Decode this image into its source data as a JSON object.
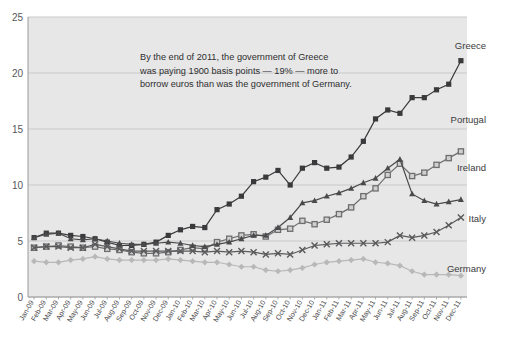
{
  "chart_data": {
    "type": "line",
    "title": "",
    "xlabel": "",
    "ylabel": "",
    "ylim": [
      0,
      25
    ],
    "yticks": [
      0,
      5,
      10,
      15,
      20,
      25
    ],
    "grid": true,
    "legend_position": "right-inline",
    "annotation": {
      "line1": "By the end of 2011, the government of Greece",
      "line2": "was paying 1900 basis points — 19% — more to",
      "line3": "borrow euros than was the government of Germany."
    },
    "categories": [
      "Jan-09",
      "Feb-09",
      "Mar-09",
      "Apr-09",
      "May-09",
      "Jun-09",
      "Jul-09",
      "Aug-09",
      "Sep-09",
      "Oct-09",
      "Nov-09",
      "Dec-09",
      "Jan-10",
      "Feb-10",
      "Mar-10",
      "Apr-10",
      "May-10",
      "Jun-10",
      "Jul-10",
      "Aug-10",
      "Sep-10",
      "Oct-10",
      "Nov-10",
      "Dec-10",
      "Jan-11",
      "Feb-11",
      "Mar-11",
      "Apr-11",
      "May-11",
      "Jun-11",
      "Jul-11",
      "Aug-11",
      "Sep-11",
      "Oct-11",
      "Nov-11",
      "Dec-11"
    ],
    "series": [
      {
        "name": "Greece",
        "color": "#3a3a3c",
        "marker": "square-filled",
        "label_x": 486,
        "label_y": 49,
        "values": [
          5.3,
          5.7,
          5.7,
          5.5,
          5.4,
          5.2,
          4.9,
          4.6,
          4.6,
          4.7,
          4.9,
          5.5,
          6.0,
          6.3,
          6.2,
          7.8,
          8.3,
          9.0,
          10.3,
          10.7,
          11.3,
          10.0,
          11.5,
          12.0,
          11.5,
          11.6,
          12.5,
          13.9,
          15.9,
          16.7,
          16.4,
          17.8,
          17.8,
          18.5,
          19.0,
          21.1
        ]
      },
      {
        "name": "Portugal",
        "color": "#6e6e70",
        "marker": "square-open",
        "label_x": 486,
        "label_y": 123,
        "values": [
          4.4,
          4.5,
          4.6,
          4.5,
          4.4,
          4.5,
          4.3,
          4.2,
          4.0,
          3.9,
          3.9,
          4.0,
          4.2,
          4.4,
          4.3,
          4.9,
          5.2,
          5.5,
          5.6,
          5.4,
          6.0,
          6.1,
          6.8,
          6.5,
          6.9,
          7.4,
          8.0,
          9.0,
          9.7,
          10.9,
          11.9,
          10.8,
          11.1,
          11.8,
          12.4,
          13.0
        ]
      },
      {
        "name": "Ireland",
        "color": "#4a4a4c",
        "marker": "triangle",
        "label_x": 486,
        "label_y": 171,
        "values": [
          5.3,
          5.6,
          5.7,
          5.2,
          5.1,
          5.2,
          5.0,
          4.8,
          4.7,
          4.7,
          4.8,
          4.9,
          4.8,
          4.6,
          4.5,
          4.7,
          4.9,
          5.2,
          5.5,
          5.5,
          6.2,
          7.1,
          8.4,
          8.6,
          9.0,
          9.3,
          9.7,
          10.2,
          10.6,
          11.5,
          12.3,
          9.2,
          8.6,
          8.3,
          8.5,
          8.7
        ]
      },
      {
        "name": "Italy",
        "color": "#5a5a5c",
        "marker": "x",
        "label_x": 486,
        "label_y": 222,
        "values": [
          4.4,
          4.5,
          4.5,
          4.4,
          4.4,
          4.7,
          4.5,
          4.3,
          4.1,
          4.1,
          4.1,
          4.1,
          4.1,
          4.1,
          4.0,
          4.1,
          4.0,
          4.1,
          4.0,
          3.8,
          3.9,
          3.8,
          4.2,
          4.6,
          4.7,
          4.8,
          4.8,
          4.8,
          4.8,
          4.9,
          5.5,
          5.3,
          5.5,
          5.8,
          6.4,
          7.1
        ]
      },
      {
        "name": "Germany",
        "color": "#b8b8b8",
        "marker": "diamond",
        "label_x": 486,
        "label_y": 272,
        "values": [
          3.2,
          3.1,
          3.1,
          3.3,
          3.4,
          3.6,
          3.4,
          3.3,
          3.3,
          3.3,
          3.3,
          3.4,
          3.3,
          3.2,
          3.1,
          3.1,
          2.9,
          2.7,
          2.7,
          2.4,
          2.3,
          2.4,
          2.6,
          2.9,
          3.1,
          3.2,
          3.3,
          3.4,
          3.1,
          3.0,
          2.8,
          2.3,
          2.0,
          2.0,
          2.0,
          1.9
        ]
      }
    ]
  },
  "colors": {
    "plot_background": "#e7e7e7",
    "gridline": "#c9c9c9",
    "axis": "#9a9a9a",
    "page_background": "#ffffff"
  }
}
